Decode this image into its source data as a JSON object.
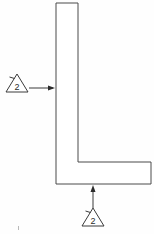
{
  "drawing": {
    "title": "L-shaped angle profile",
    "background_color": "#fefefe",
    "line_color": "#4a4a4a",
    "width": 154,
    "height": 234
  },
  "part": {
    "name": "l-profile",
    "shape": "L-bracket",
    "outline_points": "56,3 78,3 78,162 151,162 151,184 56,184"
  },
  "callouts": [
    {
      "id": "callout-left",
      "label": "2",
      "symbol": "triangle",
      "position": "left",
      "points_at": "vertical-leg-left-face",
      "arrow_direction": "right",
      "triangle": {
        "cx": 17,
        "cy": 88,
        "half_width": 11,
        "height": 15
      },
      "leader": {
        "x1": 29,
        "y1": 88,
        "x2": 55,
        "y2": 88
      },
      "arrow_tip": {
        "x": 55,
        "y": 88
      }
    },
    {
      "id": "callout-bottom",
      "label": "2",
      "symbol": "triangle",
      "position": "bottom",
      "points_at": "horizontal-foot-bottom-face",
      "arrow_direction": "up",
      "triangle": {
        "cx": 93,
        "cy": 216,
        "half_width": 11,
        "height": 15
      },
      "leader": {
        "x1": 93,
        "y1": 208,
        "x2": 93,
        "y2": 186
      },
      "arrow_tip": {
        "x": 93,
        "y": 185
      }
    }
  ],
  "colors": {
    "outline": "#4a4a4a",
    "annotation": "#3a3a3a",
    "text": "#2b2b2b",
    "background": "#fefefe"
  }
}
